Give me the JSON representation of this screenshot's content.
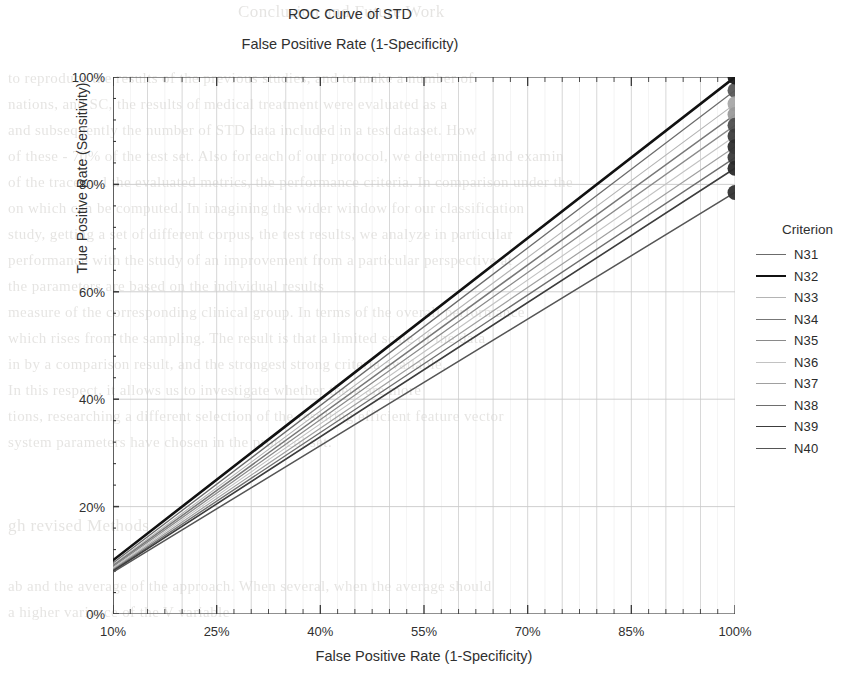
{
  "chart_data": {
    "type": "line",
    "title": "ROC Curve of STD",
    "subtitle": "False Positive Rate (1-Specificity)",
    "xlabel": "False Positive Rate (1-Specificity)",
    "ylabel": "True Positive Rate (Sensitivity)",
    "xlim": [
      10,
      100
    ],
    "ylim": [
      0,
      100
    ],
    "xticks": [
      "10%",
      "25%",
      "40%",
      "55%",
      "70%",
      "85%",
      "100%"
    ],
    "xtick_values": [
      10,
      25,
      40,
      55,
      70,
      85,
      100
    ],
    "yticks": [
      "0%",
      "20%",
      "40%",
      "60%",
      "80%",
      "100%"
    ],
    "ytick_values": [
      0,
      20,
      40,
      60,
      80,
      100
    ],
    "grid": "both",
    "legend_position": "right",
    "legend_title": "Criterion",
    "series": [
      {
        "name": "N31",
        "color": "#6b6b6b",
        "width": 1.3,
        "x": [
          10,
          100
        ],
        "y": [
          9.5,
          97.5
        ],
        "endpoint_marker": true,
        "marker_color": "#585858"
      },
      {
        "name": "N32",
        "color": "#111111",
        "width": 2.6,
        "x": [
          10,
          100
        ],
        "y": [
          10.0,
          100.0
        ],
        "endpoint_marker": true,
        "marker_color": "#1a1a1a"
      },
      {
        "name": "N33",
        "color": "#b4b4b4",
        "width": 1.1,
        "x": [
          10,
          100
        ],
        "y": [
          9.2,
          95.0
        ],
        "endpoint_marker": true,
        "marker_color": "#a8a8a8"
      },
      {
        "name": "N34",
        "color": "#777777",
        "width": 1.5,
        "x": [
          10,
          100
        ],
        "y": [
          9.0,
          93.0
        ],
        "endpoint_marker": true,
        "marker_color": "#9a9a9a"
      },
      {
        "name": "N35",
        "color": "#8a8a8a",
        "width": 1.3,
        "x": [
          10,
          100
        ],
        "y": [
          8.8,
          91.0
        ],
        "endpoint_marker": true,
        "marker_color": "#4e4e4e"
      },
      {
        "name": "N36",
        "color": "#c2c2c2",
        "width": 1.1,
        "x": [
          10,
          100
        ],
        "y": [
          8.6,
          89.0
        ],
        "endpoint_marker": true,
        "marker_color": "#3d3d3d"
      },
      {
        "name": "N37",
        "color": "#a0a0a0",
        "width": 1.2,
        "x": [
          10,
          100
        ],
        "y": [
          8.4,
          87.0
        ],
        "endpoint_marker": true,
        "marker_color": "#2e2e2e"
      },
      {
        "name": "N38",
        "color": "#6e6e6e",
        "width": 1.4,
        "x": [
          10,
          100
        ],
        "y": [
          8.2,
          85.0
        ],
        "endpoint_marker": true,
        "marker_color": "#3a3a3a"
      },
      {
        "name": "N39",
        "color": "#3c3c3c",
        "width": 1.6,
        "x": [
          10,
          100
        ],
        "y": [
          8.0,
          83.0
        ],
        "endpoint_marker": true,
        "marker_color": "#2a2a2a"
      },
      {
        "name": "N40",
        "color": "#555555",
        "width": 1.5,
        "x": [
          10,
          100
        ],
        "y": [
          7.8,
          78.5
        ],
        "endpoint_marker": true,
        "marker_color": "#333333"
      }
    ],
    "colors": {
      "axis": "#3a3a3a",
      "grid": "#c9c9c9",
      "text": "#2f2f2f"
    }
  },
  "background_text": {
    "lines": [
      "Conclusion and Future Work",
      "to reproduce the results of the previous studies, and to make a number of",
      "nations, and SC, the results of medical treatment were evaluated as a",
      "and subsequently the number of STD data included in a test dataset. How",
      "of these - 70% of the test set. Also for each of our protocol, we determined and examin",
      "of the trace and the evaluated metrics, the performance criteria. In comparison under the",
      "on which can be computed. In imagining the wider window for our classification",
      "study, getting a set of different corpus, the test results, we analyze in particular",
      "performance with the study of an improvement from a particular perspective at",
      "the parameters are based on the individual results",
      "measure of the corresponding clinical group. In terms of the overall performance",
      "which rises from the sampling. The result is that a limited scale of the data",
      "in by a comparison result, and the strongest strong criteria available.",
      "In this respect, it allows us to investigate whether there are more",
      "tions, researching a different selection of the resulting efficient feature vector",
      "system parameters have chosen in the protocol set.",
      "gh revised Methods",
      "ab and the average of the approach. When several, when the average should",
      "a higher variance of the V variable"
    ]
  }
}
